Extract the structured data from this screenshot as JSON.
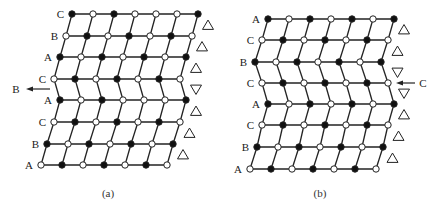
{
  "figure": {
    "panels": [
      {
        "id": "a",
        "caption": "(a)",
        "caption_pos": [
          108,
          197
        ],
        "spacing": 21,
        "rows": [
          {
            "label": "C",
            "x0": 72,
            "y": 14,
            "nodes": "FOFOOOF",
            "marker": "up"
          },
          {
            "label": "B",
            "x0": 66,
            "y": 36,
            "nodes": "OFOFOFO",
            "marker": "up"
          },
          {
            "label": "A",
            "x0": 60,
            "y": 57,
            "nodes": "FOFOFOF",
            "marker": "up"
          },
          {
            "label": "C",
            "x0": 54,
            "y": 79,
            "nodes": "OFOFOFO",
            "marker": "down"
          },
          {
            "label": "A",
            "x0": 60,
            "y": 100,
            "nodes": "FOFOOOF",
            "marker": "up"
          },
          {
            "label": "C",
            "x0": 54,
            "y": 122,
            "nodes": "OFOFOFO",
            "marker": "up"
          },
          {
            "label": "B",
            "x0": 47,
            "y": 144,
            "nodes": "FOFOFOF",
            "marker": "up"
          },
          {
            "label": "A",
            "x0": 41,
            "y": 165,
            "nodes": "OFOFOFO",
            "marker": null
          }
        ],
        "arrow": {
          "label": "B",
          "direction": "left",
          "x_from": 50,
          "x_to": 26,
          "y": 89,
          "label_x": 16
        }
      },
      {
        "id": "b",
        "caption": "(b)",
        "caption_pos": [
          320,
          197
        ],
        "spacing": 21,
        "rows": [
          {
            "label": "A",
            "x0": 268,
            "y": 19,
            "nodes": "FOFOFOF",
            "marker": "up"
          },
          {
            "label": "C",
            "x0": 262,
            "y": 40,
            "nodes": "OFOFOFO",
            "marker": "up"
          },
          {
            "label": "B",
            "x0": 255,
            "y": 62,
            "nodes": "FOFOFOF",
            "marker": "down"
          },
          {
            "label": "C",
            "x0": 262,
            "y": 83,
            "nodes": "OFOFOFO",
            "marker": "down"
          },
          {
            "label": "A",
            "x0": 268,
            "y": 104,
            "nodes": "FOFOFOF",
            "marker": "up"
          },
          {
            "label": "C",
            "x0": 262,
            "y": 125,
            "nodes": "OFOFOFO",
            "marker": "up"
          },
          {
            "label": "B",
            "x0": 257,
            "y": 147,
            "nodes": "FOFOFOF",
            "marker": "up"
          },
          {
            "label": "A",
            "x0": 250,
            "y": 169,
            "nodes": "OFOFOFO",
            "marker": null
          }
        ],
        "arrow": {
          "label": "C",
          "direction": "left",
          "x_from": 415,
          "x_to": 396,
          "y": 83,
          "label_x": 423
        }
      }
    ],
    "legend": {
      "filled": "F",
      "open": "O"
    },
    "colors": {
      "line": "#222222",
      "filled": "#111111",
      "open_fill": "#ffffff"
    }
  }
}
